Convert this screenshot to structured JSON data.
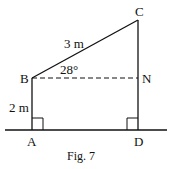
{
  "figure": {
    "caption": "Fig. 7",
    "points": {
      "A": {
        "label": "A",
        "x": 32,
        "y": 130
      },
      "B": {
        "label": "B",
        "x": 32,
        "y": 78
      },
      "C": {
        "label": "C",
        "x": 138,
        "y": 20
      },
      "D": {
        "label": "D",
        "x": 138,
        "y": 130
      },
      "N": {
        "label": "N",
        "x": 138,
        "y": 78
      }
    },
    "measurements": {
      "BC": "3 m",
      "AB": "2 m",
      "angle_CBN": "28°"
    },
    "segments": [
      {
        "from": "A",
        "to": "B",
        "style": "solid"
      },
      {
        "from": "B",
        "to": "C",
        "style": "solid"
      },
      {
        "from": "C",
        "to": "D",
        "style": "solid"
      },
      {
        "from": "B",
        "to": "N",
        "style": "dashed"
      },
      {
        "from": "ground-left",
        "to": "ground-right",
        "style": "solid"
      }
    ],
    "right_angles": [
      "A",
      "D"
    ],
    "colors": {
      "stroke": "#111111",
      "background": "#ffffff"
    }
  }
}
